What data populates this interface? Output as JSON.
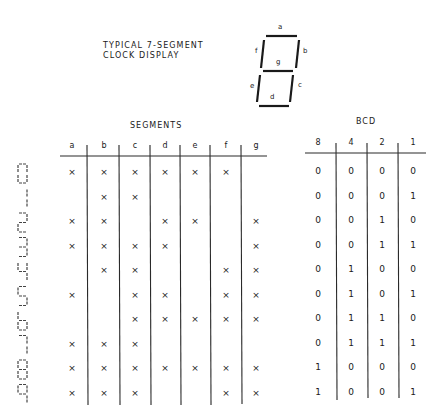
{
  "title": "TYPICAL 7-SEGMENT\nCLOCK DISPLAY",
  "segment_diagram": {
    "labels": {
      "a": "a",
      "b": "b",
      "c": "c",
      "d": "d",
      "e": "e",
      "f": "f",
      "g": "g"
    }
  },
  "segments_table": {
    "header": "SEGMENTS",
    "columns": [
      "a",
      "b",
      "c",
      "d",
      "e",
      "f",
      "g"
    ],
    "rows": [
      [
        "x",
        "x",
        "x",
        "x",
        "x",
        "x",
        ""
      ],
      [
        "",
        "x",
        "x",
        "",
        "",
        "",
        ""
      ],
      [
        "x",
        "x",
        "",
        "x",
        "x",
        "",
        "x"
      ],
      [
        "x",
        "x",
        "x",
        "x",
        "",
        "",
        "x"
      ],
      [
        "",
        "x",
        "x",
        "",
        "",
        "x",
        "x"
      ],
      [
        "x",
        "",
        "x",
        "x",
        "",
        "x",
        "x"
      ],
      [
        "",
        "",
        "x",
        "x",
        "x",
        "x",
        "x"
      ],
      [
        "x",
        "x",
        "x",
        "",
        "",
        "",
        ""
      ],
      [
        "x",
        "x",
        "x",
        "x",
        "x",
        "x",
        "x"
      ],
      [
        "x",
        "x",
        "x",
        "",
        "",
        "x",
        "x"
      ]
    ]
  },
  "bcd_table": {
    "header": "BCD",
    "columns": [
      "8",
      "4",
      "2",
      "1"
    ],
    "rows": [
      [
        "0",
        "0",
        "0",
        "0"
      ],
      [
        "0",
        "0",
        "0",
        "1"
      ],
      [
        "0",
        "0",
        "1",
        "0"
      ],
      [
        "0",
        "0",
        "1",
        "1"
      ],
      [
        "0",
        "1",
        "0",
        "0"
      ],
      [
        "0",
        "1",
        "0",
        "1"
      ],
      [
        "0",
        "1",
        "1",
        "0"
      ],
      [
        "0",
        "1",
        "1",
        "1"
      ],
      [
        "1",
        "0",
        "0",
        "0"
      ],
      [
        "1",
        "0",
        "0",
        "1"
      ]
    ]
  },
  "digits": [
    "0",
    "1",
    "2",
    "3",
    "4",
    "5",
    "6",
    "7",
    "8",
    "9"
  ]
}
